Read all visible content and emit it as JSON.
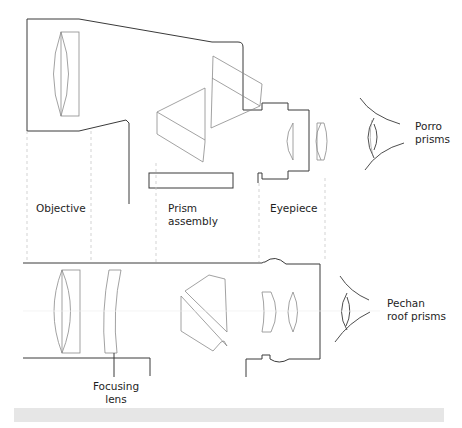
{
  "diagram": {
    "top_variant": {
      "caption_line1": "Porro",
      "caption_line2": "prisms"
    },
    "bottom_variant": {
      "caption_line1": "Pechan",
      "caption_line2": "roof prisms"
    },
    "labels": {
      "objective": "Objective",
      "prism_line1": "Prism",
      "prism_line2": "assembly",
      "eyepiece": "Eyepiece",
      "focusing_line1": "Focusing",
      "focusing_line2": "lens"
    },
    "colors": {
      "housing_stroke": "#3a3a3a",
      "optics_stroke": "#8a8a8a",
      "guide_stroke": "#c8c8c8",
      "text": "#1e1e1e",
      "footer_bar": "#e6e6e6"
    }
  }
}
